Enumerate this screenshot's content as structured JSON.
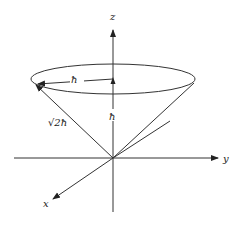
{
  "diagram": {
    "axes": {
      "z_label": "z",
      "y_label": "y",
      "x_label": "x"
    },
    "labels": {
      "radius": "ħ",
      "z_projection": "ħ",
      "magnitude": "√2ħ"
    },
    "colors": {
      "line": "#333333",
      "text": "#222222",
      "background": "#ffffff"
    }
  }
}
